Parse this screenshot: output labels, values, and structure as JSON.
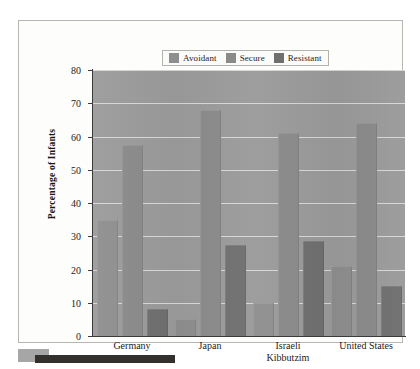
{
  "chart_data": {
    "type": "bar",
    "title": "",
    "subtitle": "",
    "xlabel": "",
    "ylabel": "Percentage of Infants",
    "categories": [
      "Germany",
      "Japan",
      "Israeli\nKibbutzim",
      "United States"
    ],
    "category_lines": [
      [
        "Germany"
      ],
      [
        "Japan"
      ],
      [
        "Israeli",
        "Kibbutzim"
      ],
      [
        "United States"
      ]
    ],
    "series": [
      {
        "name": "Avoidant",
        "values": [
          35,
          5,
          10,
          21
        ],
        "color": "#8e8e8e"
      },
      {
        "name": "Secure",
        "values": [
          57.5,
          68,
          61,
          64
        ],
        "color": "#8a8a8a"
      },
      {
        "name": "Resistant",
        "values": [
          8,
          27.5,
          28.5,
          15
        ],
        "color": "#6f6f6f"
      }
    ],
    "ylim": [
      0,
      80
    ],
    "yticks": [
      0,
      10,
      20,
      30,
      40,
      50,
      60,
      70,
      80
    ],
    "ytick_labels": [
      "0",
      "10",
      "20",
      "30",
      "40",
      "50",
      "60",
      "70",
      "80"
    ],
    "grid": true,
    "grid_color": "#d7d7d5",
    "legend_position": "top-center",
    "plot_background": "#9a9a9a",
    "panel_background": "#fdfdfc",
    "panel_border": "#b9b6b2",
    "axis_color": "#3b3b3b"
  },
  "legend": {
    "items": [
      {
        "label": "Avoidant",
        "color": "#8e8e8e"
      },
      {
        "label": "Secure",
        "color": "#8a8a8a"
      },
      {
        "label": "Resistant",
        "color": "#6f6f6f"
      }
    ]
  }
}
